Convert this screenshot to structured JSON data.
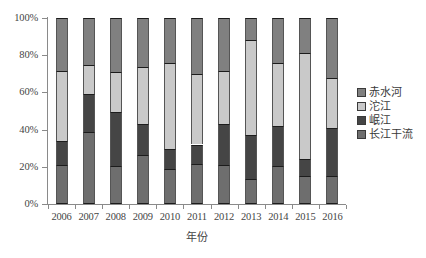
{
  "chart_data": {
    "type": "bar",
    "subtype": "stacked-100-percent",
    "title": "",
    "xlabel": "年份",
    "ylabel": "",
    "categories": [
      "2006",
      "2007",
      "2008",
      "2009",
      "2010",
      "2011",
      "2012",
      "2013",
      "2014",
      "2015",
      "2016"
    ],
    "ylim": [
      0,
      100
    ],
    "ytick_labels": [
      "0%",
      "20%",
      "40%",
      "60%",
      "80%",
      "100%"
    ],
    "ytick_values": [
      0,
      20,
      40,
      60,
      80,
      100
    ],
    "grid": false,
    "legend_position": "right",
    "stack_order_bottom_to_top": [
      "长江干流",
      "岷江",
      "沱江",
      "赤水河"
    ],
    "series": [
      {
        "name": "长江干流",
        "color": "#6e6e6e",
        "values": [
          21.0,
          38.5,
          20.5,
          26.5,
          19.0,
          21.5,
          21.0,
          13.5,
          20.5,
          15.0,
          15.0
        ]
      },
      {
        "name": "岷江",
        "color": "#454545",
        "values": [
          13.0,
          20.5,
          29.0,
          16.5,
          10.5,
          10.5,
          22.0,
          23.5,
          21.5,
          9.0,
          26.0
        ]
      },
      {
        "name": "沱江",
        "color": "#c9c9c9",
        "values": [
          37.5,
          16.0,
          21.5,
          30.5,
          46.5,
          38.0,
          28.5,
          51.0,
          34.0,
          57.0,
          27.0
        ]
      },
      {
        "name": "赤水河",
        "color": "#808080",
        "values": [
          28.5,
          25.0,
          29.0,
          26.5,
          24.0,
          30.0,
          28.5,
          12.0,
          24.0,
          19.0,
          32.0
        ]
      }
    ]
  },
  "legend": {
    "items": [
      {
        "label": "赤水河",
        "color": "#808080"
      },
      {
        "label": "沱江",
        "color": "#c9c9c9"
      },
      {
        "label": "岷江",
        "color": "#454545"
      },
      {
        "label": "长江干流",
        "color": "#6e6e6e"
      }
    ]
  },
  "axes": {
    "x_title": "年份"
  }
}
